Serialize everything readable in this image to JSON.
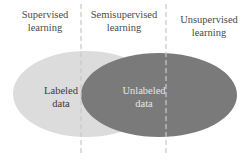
{
  "columns": [
    {
      "line1": "Supervised",
      "line2": "learning"
    },
    {
      "line1": "Semisupervised",
      "line2": "learning"
    },
    {
      "line1": "Unsupervised",
      "line2": "learning"
    }
  ],
  "sets": [
    {
      "line1": "Labeled",
      "line2": "data",
      "fill": "#dcdcdc",
      "text_color": "#3a3a3a"
    },
    {
      "line1": "Unlabeled",
      "line2": "data",
      "fill": "#7a7a7a",
      "text_color": "#e6e6e6"
    }
  ],
  "colors": {
    "divider": "#c8c8c8",
    "header_text": "#4a4a4a"
  }
}
